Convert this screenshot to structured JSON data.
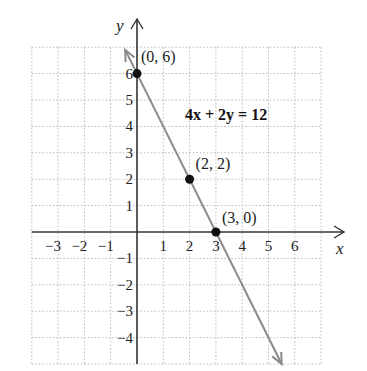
{
  "chart_data": {
    "type": "line",
    "title": "",
    "equation_label": "4x + 2y = 12",
    "xlabel": "x",
    "ylabel": "y",
    "xlim": [
      -4,
      7
    ],
    "ylim": [
      -5,
      7
    ],
    "grid": true,
    "grid_style": "dotted",
    "x_ticks": [
      -3,
      -2,
      -1,
      1,
      2,
      3,
      4,
      5,
      6
    ],
    "x_tick_labels": [
      "−3",
      "−2",
      "−1",
      "1",
      "2",
      "3",
      "4",
      "5",
      "6"
    ],
    "y_ticks": [
      6,
      5,
      4,
      3,
      2,
      1,
      -1,
      -2,
      -3,
      -4
    ],
    "y_tick_labels": [
      "6",
      "5",
      "4",
      "3",
      "2",
      "1",
      "−1",
      "−2",
      "−3",
      "−4"
    ],
    "series": [
      {
        "name": "4x + 2y = 12",
        "equation": "y = -2x + 6",
        "slope": -2,
        "intercept": 6,
        "x_range": [
          -0.45,
          5.5
        ],
        "color": "#8a8a8a"
      }
    ],
    "points": [
      {
        "x": 0,
        "y": 6,
        "label": "(0, 6)"
      },
      {
        "x": 2,
        "y": 2,
        "label": "(2, 2)"
      },
      {
        "x": 3,
        "y": 0,
        "label": "(3, 0)"
      }
    ]
  },
  "colors": {
    "axis": "#333333",
    "grid": "#b8b8b8",
    "line": "#8a8a8a",
    "point": "#111111"
  }
}
